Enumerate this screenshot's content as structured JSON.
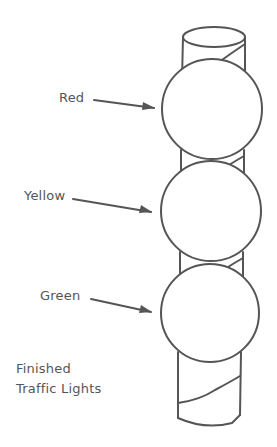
{
  "diagram": {
    "labels": {
      "red": "Red",
      "yellow": "Yellow",
      "green": "Green"
    },
    "caption": {
      "line1": "Finished",
      "line2": "Traffic Lights"
    },
    "colors": {
      "line": "#555555",
      "background": "#ffffff"
    }
  }
}
